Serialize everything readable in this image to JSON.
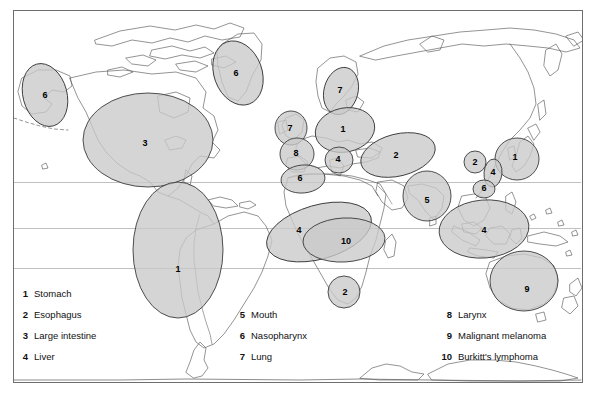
{
  "figure": {
    "type": "map",
    "frame": {
      "x": 13,
      "y": 10,
      "width": 569,
      "height": 372
    },
    "colors": {
      "background": "#ffffff",
      "region_fill": "#c9c9c9",
      "region_fill_overlap": "#b0b0b0",
      "region_stroke": "#3c3c3c",
      "coastline": "#5a5a5a",
      "graticule": "#b9b9b9",
      "frame_stroke": "#6e6e6e",
      "text": "#111111"
    }
  },
  "graticule": {
    "label": "latitude-lines",
    "lines_y": [
      182,
      228,
      268
    ]
  },
  "legend": {
    "columns": [
      {
        "name": "legend-column-1",
        "x_number": 28,
        "x_label": 34,
        "items": [
          {
            "number": "1",
            "label": "Stomach",
            "y": 297
          },
          {
            "number": "2",
            "label": "Esophagus",
            "y": 318
          },
          {
            "number": "3",
            "label": "Large intestine",
            "y": 339
          },
          {
            "number": "4",
            "label": "Liver",
            "y": 360
          }
        ]
      },
      {
        "name": "legend-column-2",
        "x_number": 245,
        "x_label": 251,
        "items": [
          {
            "number": "5",
            "label": "Mouth",
            "y": 318
          },
          {
            "number": "6",
            "label": "Nasopharynx",
            "y": 339
          },
          {
            "number": "7",
            "label": "Lung",
            "y": 360
          }
        ]
      },
      {
        "name": "legend-column-3",
        "x_number": 452,
        "x_label": 458,
        "items": [
          {
            "number": "8",
            "label": "Larynx",
            "y": 318
          },
          {
            "number": "9",
            "label": "Malignant melanoma",
            "y": 339
          },
          {
            "number": "10",
            "label": "Burkitt's lymphoma",
            "y": 360
          }
        ]
      }
    ]
  },
  "regions": [
    {
      "id": "r-alaska-6",
      "number": "6",
      "cancer": "Nasopharynx",
      "place": "Alaska / NW North America",
      "cx": 45,
      "cy": 95,
      "rx": 22,
      "ry": 32,
      "rot": -15,
      "lx": 45,
      "ly": 98
    },
    {
      "id": "r-greenland-6",
      "number": "6",
      "cancer": "Nasopharynx",
      "place": "Greenland",
      "cx": 238,
      "cy": 73,
      "rx": 24,
      "ry": 33,
      "rot": -20,
      "lx": 236,
      "ly": 76
    },
    {
      "id": "r-northamerica-3",
      "number": "3",
      "cancer": "Large intestine",
      "place": "North America",
      "cx": 148,
      "cy": 140,
      "rx": 65,
      "ry": 47,
      "rot": 0,
      "lx": 145,
      "ly": 146
    },
    {
      "id": "r-southamerica-1",
      "number": "1",
      "cancer": "Stomach",
      "place": "Andean South America",
      "cx": 178,
      "cy": 250,
      "rx": 45,
      "ry": 68,
      "rot": 0,
      "lx": 178,
      "ly": 272
    },
    {
      "id": "r-scandinavia-7",
      "number": "7",
      "cancer": "Lung",
      "place": "Scandinavia",
      "cx": 341,
      "cy": 91,
      "rx": 17,
      "ry": 24,
      "rot": 15,
      "lx": 340,
      "ly": 93
    },
    {
      "id": "r-britain-7",
      "number": "7",
      "cancer": "Lung",
      "place": "British Isles",
      "cx": 291,
      "cy": 128,
      "rx": 16,
      "ry": 17,
      "rot": 0,
      "lx": 290,
      "ly": 131
    },
    {
      "id": "r-easteurope-1",
      "number": "1",
      "cancer": "Stomach",
      "place": "Eastern Europe / Russia",
      "cx": 345,
      "cy": 130,
      "rx": 30,
      "ry": 22,
      "rot": -12,
      "lx": 343,
      "ly": 132
    },
    {
      "id": "r-france-8",
      "number": "8",
      "cancer": "Larynx",
      "place": "France / Iberia",
      "cx": 297,
      "cy": 154,
      "rx": 17,
      "ry": 16,
      "rot": 0,
      "lx": 296,
      "ly": 156
    },
    {
      "id": "r-italy-4",
      "number": "4",
      "cancer": "Liver",
      "place": "Italy / Balkans",
      "cx": 339,
      "cy": 160,
      "rx": 14,
      "ry": 13,
      "rot": 0,
      "lx": 338,
      "ly": 162
    },
    {
      "id": "r-maghreb-6",
      "number": "6",
      "cancer": "Nasopharynx",
      "place": "North-west Africa",
      "cx": 303,
      "cy": 179,
      "rx": 22,
      "ry": 14,
      "rot": -5,
      "lx": 300,
      "ly": 181
    },
    {
      "id": "r-centralasia-2",
      "number": "2",
      "cancer": "Esophagus",
      "place": "Central Asia / Caspian",
      "cx": 398,
      "cy": 155,
      "rx": 38,
      "ry": 21,
      "rot": -14,
      "lx": 396,
      "ly": 158
    },
    {
      "id": "r-india-5",
      "number": "5",
      "cancer": "Mouth",
      "place": "India",
      "cx": 427,
      "cy": 196,
      "rx": 24,
      "ry": 25,
      "rot": 0,
      "lx": 427,
      "ly": 203
    },
    {
      "id": "r-africa-4",
      "number": "4",
      "cancer": "Liver",
      "place": "Sub-Saharan Africa",
      "cx": 319,
      "cy": 232,
      "rx": 54,
      "ry": 27,
      "rot": -16,
      "lx": 299,
      "ly": 233
    },
    {
      "id": "r-africa-10",
      "number": "10",
      "cancer": "Burkitt's lymphoma",
      "place": "Equatorial Africa belt",
      "cx": 344,
      "cy": 240,
      "rx": 41,
      "ry": 22,
      "rot": -3,
      "lx": 346,
      "ly": 244
    },
    {
      "id": "r-southafrica-2",
      "number": "2",
      "cancer": "Esophagus",
      "place": "Southern Africa",
      "cx": 344,
      "cy": 292,
      "rx": 16,
      "ry": 16,
      "rot": 0,
      "lx": 345,
      "ly": 295
    },
    {
      "id": "r-japan-1",
      "number": "1",
      "cancer": "Stomach",
      "place": "Japan / Korea",
      "cx": 517,
      "cy": 159,
      "rx": 22,
      "ry": 21,
      "rot": 0,
      "lx": 515,
      "ly": 160
    },
    {
      "id": "r-china-2",
      "number": "2",
      "cancer": "Esophagus",
      "place": "Northern China",
      "cx": 475,
      "cy": 162,
      "rx": 11,
      "ry": 11,
      "rot": 0,
      "lx": 475,
      "ly": 165
    },
    {
      "id": "r-taiwan-4",
      "number": "4",
      "cancer": "Liver",
      "place": "SE China / Taiwan",
      "cx": 493,
      "cy": 173,
      "rx": 9,
      "ry": 14,
      "rot": 5,
      "lx": 493,
      "ly": 175
    },
    {
      "id": "r-guangdong-6",
      "number": "6",
      "cancer": "Nasopharynx",
      "place": "Southern China",
      "cx": 484,
      "cy": 189,
      "rx": 11,
      "ry": 9,
      "rot": 0,
      "lx": 484,
      "ly": 191
    },
    {
      "id": "r-seasia-4",
      "number": "4",
      "cancer": "Liver",
      "place": "South-east Asia",
      "cx": 484,
      "cy": 229,
      "rx": 45,
      "ry": 29,
      "rot": -5,
      "lx": 484,
      "ly": 233
    },
    {
      "id": "r-australia-9",
      "number": "9",
      "cancer": "Malignant melanoma",
      "place": "Australia",
      "cx": 524,
      "cy": 281,
      "rx": 34,
      "ry": 30,
      "rot": 0,
      "lx": 527,
      "ly": 292
    }
  ]
}
